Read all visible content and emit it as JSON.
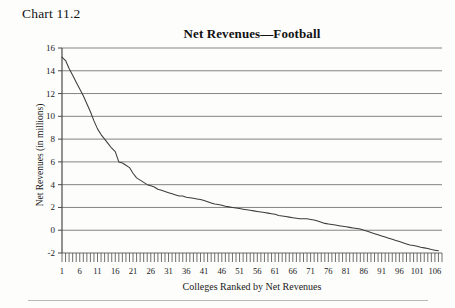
{
  "figure": {
    "number_label": "Chart 11.2"
  },
  "chart_data": {
    "type": "line",
    "title": "Net Revenues—Football",
    "xlabel": "Colleges Ranked by Net Revenues",
    "ylabel": "Net Revenues (in millions)",
    "xlim": [
      1,
      108
    ],
    "ylim": [
      -2,
      16
    ],
    "grid": true,
    "legend": "none",
    "y_ticks": [
      -2,
      0,
      2,
      4,
      6,
      8,
      10,
      12,
      14,
      16
    ],
    "y_tick_labels": [
      "-2",
      "0",
      "2",
      "4",
      "6",
      "8",
      "10",
      "12",
      "14",
      "16"
    ],
    "x_ticks": [
      1,
      6,
      11,
      16,
      21,
      26,
      31,
      36,
      41,
      46,
      51,
      56,
      61,
      66,
      71,
      76,
      81,
      86,
      91,
      96,
      101,
      106
    ],
    "x_tick_labels": [
      "1",
      "6",
      "11",
      "16",
      "21",
      "26",
      "31",
      "36",
      "41",
      "46",
      "51",
      "56",
      "61",
      "66",
      "71",
      "76",
      "81",
      "86",
      "91",
      "96",
      "101",
      "106"
    ],
    "x_minor_tick_step": 1,
    "series": [
      {
        "name": "Net Revenues",
        "color": "#3c3c3c",
        "x": [
          1,
          2,
          3,
          4,
          5,
          6,
          7,
          8,
          9,
          10,
          11,
          12,
          13,
          14,
          15,
          16,
          17,
          18,
          19,
          20,
          21,
          22,
          23,
          24,
          25,
          26,
          27,
          28,
          29,
          30,
          31,
          32,
          33,
          34,
          35,
          36,
          37,
          38,
          39,
          40,
          41,
          42,
          43,
          44,
          45,
          46,
          47,
          48,
          49,
          50,
          51,
          52,
          53,
          54,
          55,
          56,
          57,
          58,
          59,
          60,
          61,
          62,
          63,
          64,
          65,
          66,
          67,
          68,
          69,
          70,
          71,
          72,
          73,
          74,
          75,
          76,
          77,
          78,
          79,
          80,
          81,
          82,
          83,
          84,
          85,
          86,
          87,
          88,
          89,
          90,
          91,
          92,
          93,
          94,
          95,
          96,
          97,
          98,
          99,
          100,
          101,
          102,
          103,
          104,
          105,
          106,
          107
        ],
        "y": [
          15.2,
          14.9,
          14.2,
          13.6,
          13.0,
          12.4,
          11.8,
          11.1,
          10.4,
          9.6,
          8.9,
          8.4,
          8.0,
          7.6,
          7.2,
          6.9,
          6.0,
          5.9,
          5.7,
          5.5,
          5.0,
          4.6,
          4.4,
          4.2,
          4.0,
          3.9,
          3.8,
          3.6,
          3.5,
          3.4,
          3.3,
          3.2,
          3.1,
          3.0,
          3.0,
          2.9,
          2.85,
          2.8,
          2.75,
          2.7,
          2.6,
          2.5,
          2.4,
          2.3,
          2.25,
          2.2,
          2.1,
          2.05,
          2.0,
          1.95,
          1.9,
          1.85,
          1.8,
          1.75,
          1.7,
          1.65,
          1.6,
          1.55,
          1.5,
          1.45,
          1.4,
          1.3,
          1.25,
          1.2,
          1.15,
          1.1,
          1.05,
          1.0,
          1.0,
          1.0,
          0.95,
          0.9,
          0.8,
          0.7,
          0.6,
          0.55,
          0.5,
          0.45,
          0.4,
          0.35,
          0.3,
          0.25,
          0.2,
          0.15,
          0.1,
          0.0,
          -0.1,
          -0.2,
          -0.3,
          -0.4,
          -0.5,
          -0.6,
          -0.7,
          -0.8,
          -0.9,
          -1.0,
          -1.1,
          -1.2,
          -1.3,
          -1.35,
          -1.4,
          -1.5,
          -1.55,
          -1.6,
          -1.7,
          -1.75,
          -1.8
        ]
      }
    ]
  }
}
